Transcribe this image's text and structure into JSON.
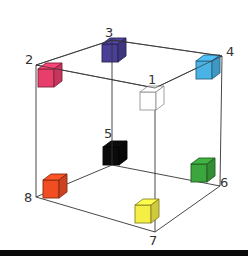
{
  "diagram": {
    "title": "",
    "type": "cube-vertex-colors",
    "vertices": [
      {
        "id": "1",
        "label": "1",
        "color": "#ffffff",
        "color_name": "white",
        "x": 152,
        "y": 98,
        "label_x": 148,
        "label_y": 73
      },
      {
        "id": "2",
        "label": "2",
        "color": "#e83e6c",
        "color_name": "pink-red",
        "x": 50,
        "y": 75,
        "label_x": 25,
        "label_y": 53
      },
      {
        "id": "3",
        "label": "3",
        "color": "#4a3f96",
        "color_name": "indigo",
        "x": 114,
        "y": 50,
        "label_x": 105,
        "label_y": 26
      },
      {
        "id": "4",
        "label": "4",
        "color": "#4ab3e6",
        "color_name": "sky-blue",
        "x": 208,
        "y": 67,
        "label_x": 226,
        "label_y": 45
      },
      {
        "id": "5",
        "label": "5",
        "color": "#0b0b0b",
        "color_name": "black",
        "x": 115,
        "y": 153,
        "label_x": 104,
        "label_y": 127
      },
      {
        "id": "6",
        "label": "6",
        "color": "#3ca63e",
        "color_name": "green",
        "x": 203,
        "y": 170,
        "label_x": 220,
        "label_y": 176
      },
      {
        "id": "7",
        "label": "7",
        "color": "#f4ee45",
        "color_name": "yellow",
        "x": 147,
        "y": 211,
        "label_x": 149,
        "label_y": 234
      },
      {
        "id": "8",
        "label": "8",
        "color": "#f04d23",
        "color_name": "orange-red",
        "x": 55,
        "y": 186,
        "label_x": 24,
        "label_y": 191
      }
    ],
    "frame_corners": {
      "1": [
        155,
        88
      ],
      "2": [
        36,
        65
      ],
      "3": [
        112,
        40
      ],
      "4": [
        222,
        56
      ],
      "5": [
        112,
        165
      ],
      "6": [
        220,
        186
      ],
      "7": [
        155,
        232
      ],
      "8": [
        36,
        197
      ]
    },
    "edges": [
      [
        "2",
        "3"
      ],
      [
        "3",
        "4"
      ],
      [
        "4",
        "1"
      ],
      [
        "1",
        "2"
      ],
      [
        "8",
        "5"
      ],
      [
        "5",
        "6"
      ],
      [
        "6",
        "7"
      ],
      [
        "7",
        "8"
      ],
      [
        "2",
        "8"
      ],
      [
        "3",
        "5"
      ],
      [
        "4",
        "6"
      ],
      [
        "1",
        "7"
      ]
    ],
    "edge_color": "#333333",
    "cube_size": 24
  }
}
